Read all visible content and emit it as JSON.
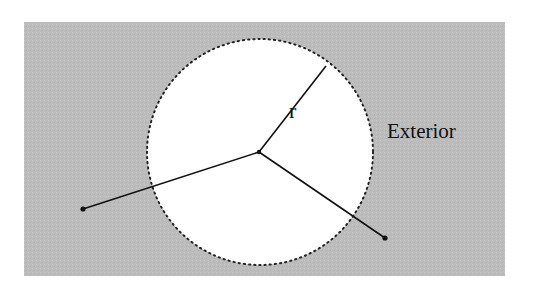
{
  "diagram": {
    "labels": {
      "radius": "r",
      "region": "Exterior"
    },
    "colors": {
      "exterior_fill": "#bdbdbd",
      "interior_fill": "#ffffff",
      "line": "#111111",
      "boundary": "#222222"
    },
    "elements": [
      {
        "type": "region",
        "name": "exterior"
      },
      {
        "type": "circle",
        "name": "interior-disk",
        "boundary": "dotted"
      },
      {
        "type": "segment",
        "name": "radius",
        "from": "center",
        "to": "boundary"
      },
      {
        "type": "segment",
        "name": "segment-to-left-exterior-point",
        "from": "center",
        "to": "exterior-point-left"
      },
      {
        "type": "segment",
        "name": "segment-to-right-exterior-point",
        "from": "center",
        "to": "exterior-point-right"
      }
    ]
  }
}
